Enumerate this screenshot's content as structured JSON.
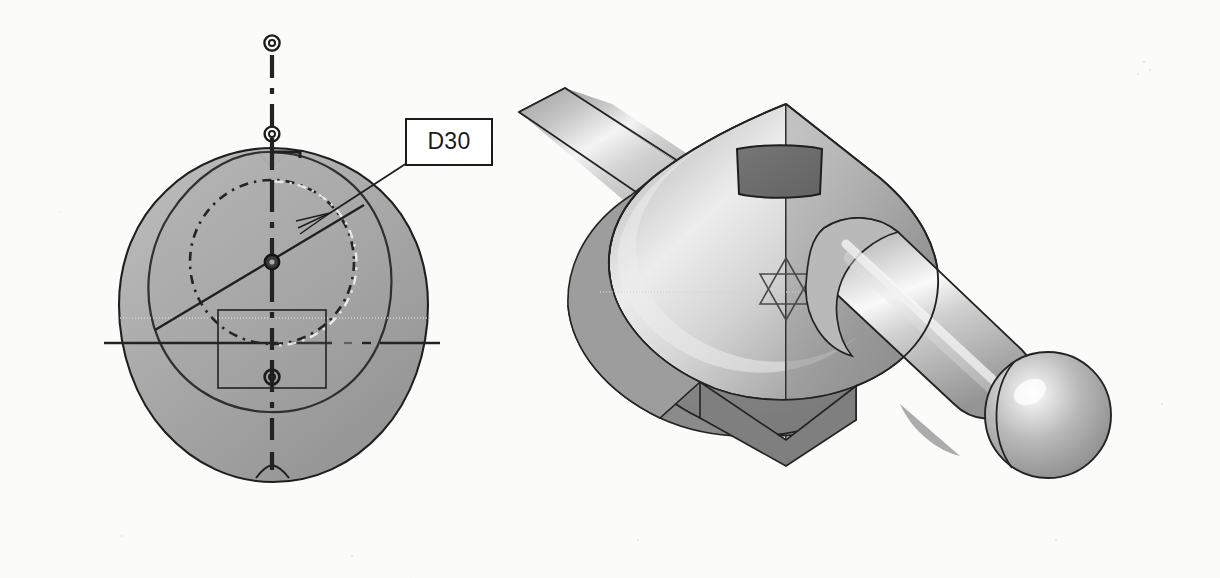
{
  "figure": {
    "kind": "cad-drawing-screenshot",
    "background_color": "#fdfdfc",
    "views": [
      {
        "id": "front-sketch-view",
        "name": "front view with sketch circle",
        "description": "Shaded circular disc front view with hidden dashed circle, vertical and horizontal centerlines, point markers and a rectangular sketch region"
      },
      {
        "id": "iso-shaded-view",
        "name": "isometric shaded solid view",
        "description": "Shaded 3D solid of a lever body with a cylindrical shaft ending in a spherical ball, a dark rectangular pocket on the top face and a star construction marker"
      }
    ]
  },
  "callout": {
    "label": "D30",
    "box_stroke": "#1b1b1b",
    "box_fill": "#ffffff",
    "text_color": "#1b1b1b"
  },
  "colors": {
    "paper": "#fdfdfc",
    "disc_light": "#b4b4b4",
    "disc_mid": "#a2a2a2",
    "disc_dark": "#909090",
    "outline": "#1f1f1f",
    "pocket_dark": "#6e6e6e",
    "solid_light": "#cfcfcf",
    "solid_highlight": "#f2f2f2",
    "solid_mid": "#b0b0b0",
    "solid_dark": "#8e8e8e",
    "shaft_light": "#d9d9d9",
    "centerline": "#2a2a2a"
  },
  "annotations": {
    "centerline_vertical": "vertical centerline through disc",
    "centerline_horizontal": "horizontal centerline through disc",
    "point_markers": [
      "top-outer-point",
      "top-inner-point",
      "center-point",
      "lower-point"
    ],
    "sketch_rectangle": "rectangular sketch profile below circle center",
    "dashed_circle": "hidden / construction circle D30",
    "leader": "leader line from D30 box to dashed circle"
  }
}
